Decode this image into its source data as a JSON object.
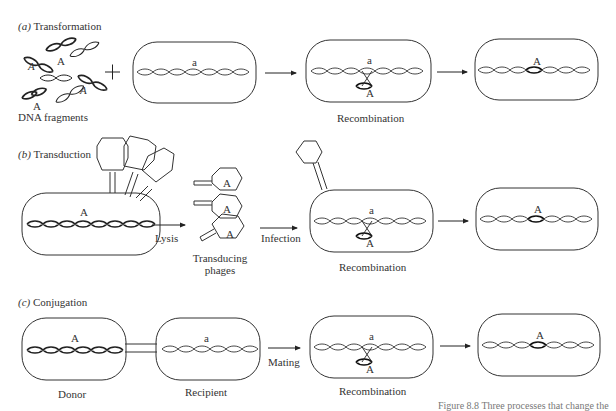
{
  "figure": {
    "panels": [
      {
        "id": "a",
        "letter": "(a)",
        "title": "Transformation",
        "labels": {
          "fragments": "DNA  fragments",
          "recombination": "Recombination",
          "plus": "+"
        },
        "alleles": {
          "fragment": "A",
          "recipient": "a",
          "insert": "A",
          "result": "A"
        }
      },
      {
        "id": "b",
        "letter": "(b)",
        "title": "Transduction",
        "labels": {
          "lysis": "Lysis",
          "phages_line1": "Transducing",
          "phages_line2": "phages",
          "infection": "Infection",
          "recombination": "Recombination"
        },
        "alleles": {
          "donor": "A",
          "phage": "A",
          "recipient": "a",
          "insert": "A",
          "result": "A"
        }
      },
      {
        "id": "c",
        "letter": "(c)",
        "title": "Conjugation",
        "labels": {
          "donor": "Donor",
          "recipient": "Recipient",
          "mating": "Mating",
          "recombination": "Recombination"
        },
        "alleles": {
          "donor": "A",
          "recipient": "a",
          "insert": "A",
          "result": "A"
        }
      }
    ],
    "caption_partial": "Figure 8.8   Three processes that change the"
  }
}
